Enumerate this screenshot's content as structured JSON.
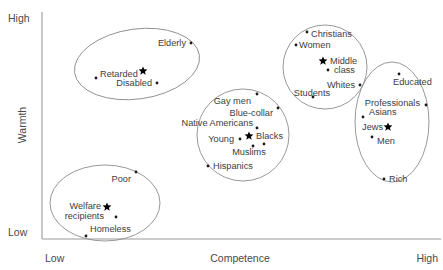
{
  "chart_data": {
    "type": "scatter",
    "title": "",
    "xlabel": "Competence",
    "ylabel": "Warmth",
    "xlim": [
      0,
      100
    ],
    "ylim": [
      0,
      100
    ],
    "grid": false,
    "legend": "none",
    "x_ticks": [
      "Low",
      "High"
    ],
    "y_ticks": [
      "High",
      "Low"
    ],
    "axes": {
      "x_low": "Low",
      "x_high": "High",
      "y_low": "Low",
      "y_high": "High"
    },
    "clusters": [
      {
        "name": "paternalistic",
        "shape": "ellipse",
        "cx": 137,
        "cy": 64,
        "rx": 63,
        "ry": 35,
        "rotation": -8
      },
      {
        "name": "ambivalent-middle",
        "shape": "ellipse",
        "cx": 243,
        "cy": 135,
        "rx": 46,
        "ry": 46,
        "rotation": 0
      },
      {
        "name": "admiration-ingroup",
        "shape": "ellipse",
        "cx": 325,
        "cy": 67,
        "rx": 42,
        "ry": 42,
        "rotation": 0
      },
      {
        "name": "envious-high-status",
        "shape": "ellipse",
        "cx": 392,
        "cy": 122,
        "rx": 37,
        "ry": 60,
        "rotation": 0
      },
      {
        "name": "contemptuous",
        "shape": "ellipse",
        "cx": 105,
        "cy": 203,
        "rx": 55,
        "ry": 38,
        "rotation": 0
      }
    ],
    "points": [
      {
        "label": "Elderly",
        "marker": "dot",
        "x": 191,
        "y": 43,
        "label_x": 186,
        "label_y": 46,
        "anchor": "end"
      },
      {
        "label": "Retarded",
        "marker": "dot",
        "x": 96,
        "y": 78,
        "label_x": 100,
        "label_y": 77,
        "anchor": "start"
      },
      {
        "label": "",
        "marker": "star",
        "x": 143,
        "y": 71,
        "label_x": 0,
        "label_y": 0,
        "anchor": "start"
      },
      {
        "label": "Disabled",
        "marker": "dot",
        "x": 157,
        "y": 83,
        "label_x": 152,
        "label_y": 86,
        "anchor": "end"
      },
      {
        "label": "Christians",
        "marker": "dot",
        "x": 307,
        "y": 32,
        "label_x": 311,
        "label_y": 37,
        "anchor": "start"
      },
      {
        "label": "Women",
        "marker": "dot",
        "x": 296,
        "y": 45,
        "label_x": 299,
        "label_y": 48,
        "anchor": "start"
      },
      {
        "label": "Middle",
        "marker": "star",
        "x": 323,
        "y": 61,
        "label_x": 330,
        "label_y": 64,
        "anchor": "start"
      },
      {
        "label": "class",
        "marker": "dot",
        "x": 328,
        "y": 70,
        "label_x": 334,
        "label_y": 73,
        "anchor": "start"
      },
      {
        "label": "Whites",
        "marker": "dot",
        "x": 360,
        "y": 85,
        "label_x": 355,
        "label_y": 88,
        "anchor": "end"
      },
      {
        "label": "Students",
        "marker": "dot",
        "x": 313,
        "y": 97,
        "label_x": 312,
        "label_y": 96,
        "anchor": "middle"
      },
      {
        "label": "Educated",
        "marker": "dot",
        "x": 399,
        "y": 74,
        "label_x": 393,
        "label_y": 85,
        "anchor": "start"
      },
      {
        "label": "Professionals",
        "marker": "dot",
        "x": 426,
        "y": 105,
        "label_x": 420,
        "label_y": 106,
        "anchor": "end"
      },
      {
        "label": "Asians",
        "marker": "dot",
        "x": 363,
        "y": 117,
        "label_x": 369,
        "label_y": 115,
        "anchor": "start"
      },
      {
        "label": "Jews",
        "marker": "star",
        "x": 388,
        "y": 127,
        "label_x": 383,
        "label_y": 130,
        "anchor": "end"
      },
      {
        "label": "Men",
        "marker": "dot",
        "x": 372,
        "y": 137,
        "label_x": 377,
        "label_y": 144,
        "anchor": "start"
      },
      {
        "label": "Rich",
        "marker": "dot",
        "x": 384,
        "y": 179,
        "label_x": 389,
        "label_y": 182,
        "anchor": "start"
      },
      {
        "label": "Gay men",
        "marker": "dot",
        "x": 257,
        "y": 94,
        "label_x": 251,
        "label_y": 104,
        "anchor": "end"
      },
      {
        "label": "Blue-collar",
        "marker": "dot",
        "x": 278,
        "y": 108,
        "label_x": 273,
        "label_y": 116,
        "anchor": "end"
      },
      {
        "label": "Native Americans",
        "marker": "dot",
        "x": 257,
        "y": 128,
        "label_x": 253,
        "label_y": 126,
        "anchor": "end"
      },
      {
        "label": "Blacks",
        "marker": "star",
        "x": 249,
        "y": 136,
        "label_x": 256,
        "label_y": 139,
        "anchor": "start"
      },
      {
        "label": "Young",
        "marker": "dot",
        "x": 240,
        "y": 139,
        "label_x": 234,
        "label_y": 142,
        "anchor": "end"
      },
      {
        "label": "Muslims",
        "marker": "dot",
        "x": 253,
        "y": 146,
        "label_x": 249,
        "label_y": 155,
        "anchor": "middle"
      },
      {
        "label": "",
        "marker": "dot",
        "x": 264,
        "y": 144,
        "label_x": 0,
        "label_y": 0,
        "anchor": "start"
      },
      {
        "label": "Hispanics",
        "marker": "dot",
        "x": 208,
        "y": 166,
        "label_x": 213,
        "label_y": 169,
        "anchor": "start"
      },
      {
        "label": "Poor",
        "marker": "dot",
        "x": 136,
        "y": 172,
        "label_x": 131,
        "label_y": 182,
        "anchor": "end"
      },
      {
        "label": "Welfare",
        "marker": "star",
        "x": 107,
        "y": 207,
        "label_x": 101,
        "label_y": 209,
        "anchor": "end"
      },
      {
        "label": "recipients",
        "marker": "dot",
        "x": 116,
        "y": 217,
        "label_x": 104,
        "label_y": 219,
        "anchor": "end"
      },
      {
        "label": "Homeless",
        "marker": "dot",
        "x": 86,
        "y": 236,
        "label_x": 90,
        "label_y": 232,
        "anchor": "start"
      }
    ],
    "axis_geometry": {
      "x_axis_y": 239,
      "y_axis_x": 42,
      "x_axis_x1": 42,
      "x_axis_x2": 441,
      "y_axis_y1": 12,
      "y_axis_y2": 239
    },
    "colors": {
      "axis": "#9a9a9a",
      "ellipse": "#8c8c8c",
      "marker": "#1a1a1a",
      "text": "#4a4a4a",
      "background": "#ffffff"
    }
  }
}
